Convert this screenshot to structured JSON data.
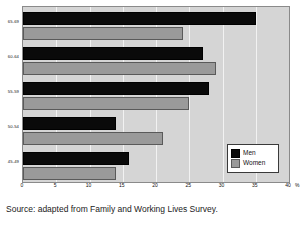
{
  "chart_data": {
    "type": "bar",
    "orientation": "horizontal",
    "title": "",
    "xlabel": "%",
    "ylabel": "",
    "categories": [
      "65-69",
      "60-64",
      "55-59",
      "50-54",
      "45-49"
    ],
    "series": [
      {
        "name": "Men",
        "color": "#0a0a0a",
        "values": [
          35,
          27,
          28,
          14,
          16
        ]
      },
      {
        "name": "Women",
        "color": "#9a9a9a",
        "values": [
          24,
          29,
          25,
          21,
          14
        ]
      }
    ],
    "xlim": [
      0,
      40
    ],
    "xticks": [
      0,
      5,
      10,
      15,
      20,
      25,
      30,
      35,
      40
    ],
    "xtick_labels": [
      "0",
      "5",
      "10",
      "15",
      "20",
      "25",
      "30",
      "35",
      "40"
    ],
    "x_unit_label": "%",
    "grid": true,
    "grid_axis": "x",
    "grid_color": "#f2f2f2",
    "plot_background": "#d5d5d5",
    "legend": {
      "position": "bottom-right",
      "entries": [
        {
          "label": "Men",
          "color": "#0a0a0a"
        },
        {
          "label": "Women",
          "color": "#9a9a9a"
        }
      ]
    }
  },
  "caption": {
    "text": "Source: adapted from Family and Working Lives Survey."
  }
}
